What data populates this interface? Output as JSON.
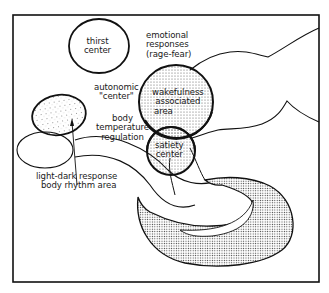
{
  "diagram": {
    "colors": {
      "line": "#111111",
      "stipple": "#8a8a8a",
      "background": "#ffffff"
    },
    "labels": {
      "thirst": [
        "thirst",
        "center"
      ],
      "emotional": [
        "emotional",
        "responses",
        "(rage-fear)"
      ],
      "autonomic": [
        "autonomic",
        "\"center\""
      ],
      "wakefulness": [
        "wakefulness",
        "associated",
        "area"
      ],
      "body_temp": [
        "body",
        "temperature",
        "regulation"
      ],
      "satiety": [
        "satiety",
        "center"
      ],
      "light_dark": [
        "light-dark response",
        "body rhythm area"
      ]
    }
  }
}
